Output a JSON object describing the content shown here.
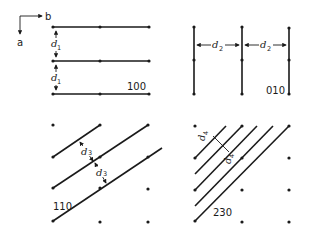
{
  "figure": {
    "axes": {
      "horizontal_label": "b",
      "vertical_label": "a"
    },
    "panels": [
      {
        "id": "100",
        "label": "100",
        "spacing_symbol": "d",
        "spacing_subscript": "1"
      },
      {
        "id": "010",
        "label": "010",
        "spacing_symbol": "d",
        "spacing_subscript": "2"
      },
      {
        "id": "110",
        "label": "110",
        "spacing_symbol": "d",
        "spacing_subscript": "3"
      },
      {
        "id": "230",
        "label": "230",
        "spacing_symbol": "d",
        "spacing_subscript": "4"
      }
    ],
    "colors": {
      "ink": "#1a1a1a",
      "background": "#ffffff"
    }
  }
}
